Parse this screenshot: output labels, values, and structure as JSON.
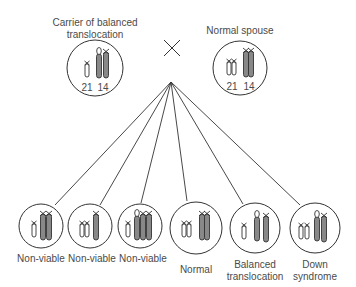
{
  "cross_symbol": "×",
  "parents": [
    {
      "label_line1": "Carrier of balanced",
      "label_line2": "translocation",
      "chrom_labels": [
        "21",
        "14"
      ]
    },
    {
      "label_line1": "Normal spouse",
      "label_line2": "",
      "chrom_labels": [
        "21",
        "14"
      ]
    }
  ],
  "offspring": [
    {
      "label_line1": "Non-viable",
      "label_line2": ""
    },
    {
      "label_line1": "Non-viable",
      "label_line2": ""
    },
    {
      "label_line1": "Non-viable",
      "label_line2": ""
    },
    {
      "label_line1": "Normal",
      "label_line2": ""
    },
    {
      "label_line1": "Balanced",
      "label_line2": "translocation"
    },
    {
      "label_line1": "Down",
      "label_line2": "syndrome"
    }
  ],
  "colors": {
    "line": "#333333",
    "chromosome_fill": "#777777",
    "text": "#4a4a4a"
  }
}
